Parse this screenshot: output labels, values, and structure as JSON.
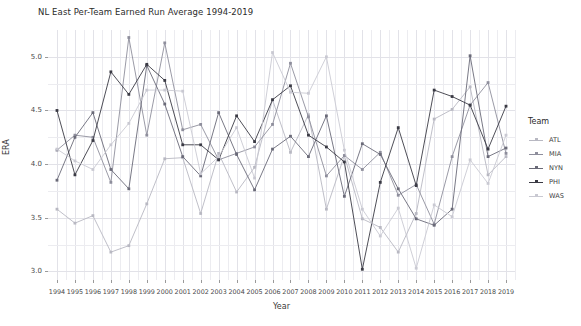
{
  "chart_data": {
    "type": "line",
    "title": "NL East Per-Team Earned Run Average 1994-2019",
    "xlabel": "Year",
    "ylabel": "ERA",
    "legend_title": "Team",
    "legend_position": "right",
    "grid": true,
    "xlim": [
      1993.5,
      2019.5
    ],
    "ylim": [
      2.92,
      5.25
    ],
    "yticks": [
      "3.0",
      "3.5",
      "4.0",
      "4.5",
      "5.0"
    ],
    "ytick_values": [
      3.0,
      3.5,
      4.0,
      4.5,
      5.0
    ],
    "categories": [
      1994,
      1995,
      1996,
      1997,
      1998,
      1999,
      2000,
      2001,
      2002,
      2003,
      2004,
      2005,
      2006,
      2007,
      2008,
      2009,
      2010,
      2011,
      2012,
      2013,
      2014,
      2015,
      2016,
      2017,
      2018,
      2019
    ],
    "x": [
      "1994",
      "1995",
      "1996",
      "1997",
      "1998",
      "1999",
      "2000",
      "2001",
      "2002",
      "2003",
      "2004",
      "2005",
      "2006",
      "2007",
      "2008",
      "2009",
      "2010",
      "2011",
      "2012",
      "2013",
      "2014",
      "2015",
      "2016",
      "2017",
      "2018",
      "2019"
    ],
    "series": [
      {
        "name": "ATL",
        "color": "#b8b8c2",
        "values": [
          3.58,
          3.45,
          3.52,
          3.18,
          3.24,
          3.63,
          4.05,
          4.06,
          3.54,
          4.1,
          3.74,
          3.97,
          4.6,
          4.11,
          4.46,
          3.58,
          4.08,
          3.49,
          3.41,
          3.18,
          3.54,
          4.42,
          4.51,
          4.72,
          3.9,
          4.07
        ]
      },
      {
        "name": "MIA",
        "color": "#8e8e9c",
        "values": [
          4.13,
          4.27,
          4.25,
          3.83,
          5.18,
          4.27,
          5.13,
          4.32,
          4.37,
          4.04,
          4.1,
          4.16,
          4.37,
          4.94,
          4.44,
          3.89,
          4.08,
          3.95,
          4.11,
          3.71,
          3.81,
          3.44,
          4.07,
          4.55,
          4.76,
          4.1
        ]
      },
      {
        "name": "NYN",
        "color": "#6a6a78"
      },
      {
        "name": "PHI",
        "color": "#3a3a44",
        "values": [
          4.5,
          3.9,
          4.22,
          4.86,
          4.65,
          4.93,
          4.78,
          4.18,
          4.18,
          4.04,
          4.45,
          4.21,
          4.6,
          4.73,
          4.27,
          4.16,
          4.02,
          3.02,
          3.83,
          4.34,
          3.8,
          4.69,
          4.63,
          4.55,
          4.14,
          4.54
        ]
      },
      {
        "name": "WAS",
        "color": "#c9c9d2",
        "values": [
          4.14,
          4.03,
          3.95,
          4.18,
          4.38,
          4.69,
          4.69,
          4.68,
          3.91,
          4.07,
          4.34,
          3.87,
          5.04,
          4.67,
          4.66,
          5.0,
          4.13,
          3.58,
          3.33,
          3.59,
          3.03,
          3.62,
          3.51,
          4.04,
          3.82,
          4.27
        ]
      }
    ],
    "series_nyn_values": [
      3.85,
      4.25,
      4.48,
      3.95,
      3.77,
      4.92,
      4.56,
      4.07,
      3.89,
      4.48,
      4.09,
      3.76,
      4.14,
      4.26,
      4.07,
      4.45,
      3.7,
      4.19,
      4.09,
      3.77,
      3.49,
      3.43,
      3.58,
      5.01,
      4.07,
      4.15
    ],
    "notes": {
      "marker": "filled-square",
      "line_width": 0.9
    }
  },
  "legend": {
    "title": "Team",
    "items": [
      {
        "label": "ATL",
        "color": "#b8b8c2"
      },
      {
        "label": "MIA",
        "color": "#8e8e9c"
      },
      {
        "label": "NYN",
        "color": "#6a6a78"
      },
      {
        "label": "PHI",
        "color": "#3a3a44"
      },
      {
        "label": "WAS",
        "color": "#c9c9d2"
      }
    ]
  }
}
